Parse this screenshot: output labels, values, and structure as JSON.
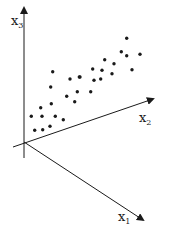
{
  "diagram": {
    "type": "3d-scatter-axes",
    "axes": [
      {
        "name": "x3",
        "label": "x",
        "subscript": "3",
        "from": [
          24,
          158
        ],
        "to": [
          24,
          8
        ],
        "label_pos": [
          11,
          25
        ]
      },
      {
        "name": "x2",
        "label": "x",
        "subscript": "2",
        "from": [
          13,
          147
        ],
        "to": [
          153,
          99
        ],
        "label_pos": [
          139,
          122
        ]
      },
      {
        "name": "x1",
        "label": "x",
        "subscript": "1",
        "from": [
          24,
          142
        ],
        "to": [
          143,
          220
        ],
        "label_pos": [
          118,
          221
        ]
      }
    ],
    "colors": {
      "ink": "#1a1a1a",
      "background": "#ffffff"
    },
    "points": [
      [
        52.7,
        71.7
      ],
      [
        70,
        79
      ],
      [
        79.3,
        77
      ],
      [
        50.7,
        87
      ],
      [
        66.7,
        96.3
      ],
      [
        77.3,
        91.7
      ],
      [
        74.7,
        101.7
      ],
      [
        51.3,
        103.7
      ],
      [
        40.7,
        107.7
      ],
      [
        31.3,
        116.3
      ],
      [
        42,
        116.3
      ],
      [
        55.3,
        116.3
      ],
      [
        63.3,
        119.7
      ],
      [
        34.7,
        130.3
      ],
      [
        42.7,
        129.7
      ],
      [
        50,
        126.3
      ],
      [
        126.7,
        38.3
      ],
      [
        121.3,
        51.7
      ],
      [
        126.7,
        55.7
      ],
      [
        140,
        54.3
      ],
      [
        104.7,
        59.7
      ],
      [
        114,
        63.7
      ],
      [
        92.7,
        69
      ],
      [
        102,
        70.3
      ],
      [
        112,
        73.7
      ],
      [
        132,
        69.7
      ],
      [
        94,
        80.3
      ],
      [
        100.7,
        79
      ],
      [
        90.7,
        91.7
      ],
      [
        80,
        77
      ]
    ]
  }
}
